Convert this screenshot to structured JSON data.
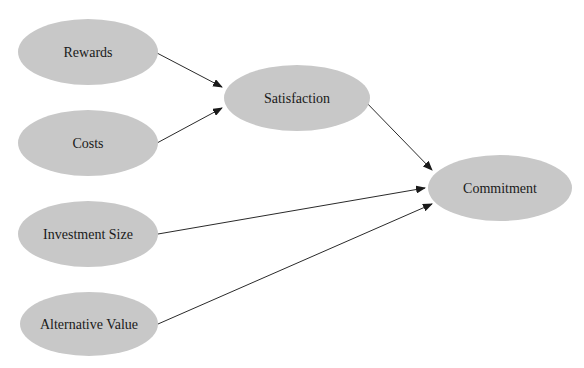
{
  "diagram": {
    "type": "path-model",
    "colors": {
      "node_fill": "#c8c8c8",
      "edge": "#2a2a2a",
      "text": "#1a1a1a",
      "background": "#ffffff"
    },
    "nodes": [
      {
        "id": "rewards",
        "label": "Rewards",
        "cx": 88,
        "cy": 52,
        "rx": 70,
        "ry": 33
      },
      {
        "id": "costs",
        "label": "Costs",
        "cx": 88,
        "cy": 143,
        "rx": 70,
        "ry": 33
      },
      {
        "id": "satisfaction",
        "label": "Satisfaction",
        "cx": 297,
        "cy": 98,
        "rx": 73,
        "ry": 33
      },
      {
        "id": "commitment",
        "label": "Commitment",
        "cx": 500,
        "cy": 188,
        "rx": 72,
        "ry": 33
      },
      {
        "id": "investment_size",
        "label": "Investment Size",
        "cx": 88,
        "cy": 234,
        "rx": 70,
        "ry": 33
      },
      {
        "id": "alternative_value",
        "label": "Alternative Value",
        "cx": 89,
        "cy": 324,
        "rx": 69,
        "ry": 32
      }
    ],
    "edges": [
      {
        "from": "rewards",
        "to": "satisfaction",
        "x1": 157,
        "y1": 53,
        "x2": 222,
        "y2": 87
      },
      {
        "from": "costs",
        "to": "satisfaction",
        "x1": 157,
        "y1": 143,
        "x2": 222,
        "y2": 108
      },
      {
        "from": "satisfaction",
        "to": "commitment",
        "x1": 362,
        "y1": 98,
        "x2": 432,
        "y2": 170
      },
      {
        "from": "investment_size",
        "to": "commitment",
        "x1": 158,
        "y1": 234,
        "x2": 425,
        "y2": 188
      },
      {
        "from": "alternative_value",
        "to": "commitment",
        "x1": 158,
        "y1": 324,
        "x2": 432,
        "y2": 204
      }
    ]
  }
}
